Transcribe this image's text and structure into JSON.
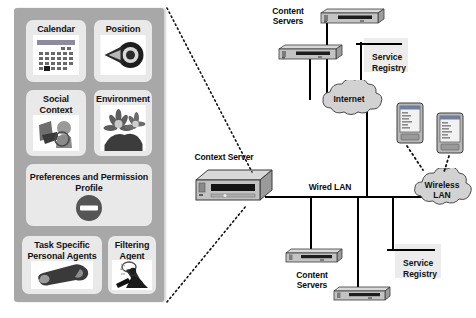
{
  "figure": {
    "background_color": "#ffffff",
    "panel_color": "#a8a8a8",
    "tile_color": "#e9e9e9",
    "wire_color": "#000000",
    "cloud_color": "#d0d0d0"
  },
  "client_panel": {
    "name": "Mobile client context panel",
    "tiles": [
      {
        "id": "calendar",
        "label": "Calendar",
        "icon": "calendar-icon"
      },
      {
        "id": "position",
        "label": "Position",
        "icon": "target-arrow-icon"
      },
      {
        "id": "social",
        "label": "Social\nContext",
        "icon": "handshake-people-icon"
      },
      {
        "id": "environment",
        "label": "Environment",
        "icon": "plants-flowers-icon"
      },
      {
        "id": "preferences",
        "label": "Preferences and\nPermission Profile",
        "icon": "no-entry-icon"
      },
      {
        "id": "task-agents",
        "label": "Task Specific\nPersonal Agents",
        "icon": "wrench-icon"
      },
      {
        "id": "filtering",
        "label": "Filtering\nAgent",
        "icon": "worker-shovel-icon"
      }
    ]
  },
  "network": {
    "nodes": [
      {
        "id": "content-servers-top",
        "label": "Content\nServers",
        "icon": "server-icon"
      },
      {
        "id": "service-registry-top",
        "label": "Service\nRegistry",
        "icon": "registry-icon"
      },
      {
        "id": "internet-cloud",
        "label": "Internet",
        "icon": "cloud-icon"
      },
      {
        "id": "context-server",
        "label": "Context Server",
        "icon": "context-server-icon"
      },
      {
        "id": "wired-lan",
        "label": "Wired LAN",
        "icon": "bus-line-icon"
      },
      {
        "id": "wireless-lan",
        "label": "Wireless\nLAN",
        "icon": "cloud-icon"
      },
      {
        "id": "content-servers-bottom",
        "label": "Content\nServers",
        "icon": "server-icon"
      },
      {
        "id": "service-registry-bottom",
        "label": "Service\nRegistry",
        "icon": "registry-icon"
      },
      {
        "id": "pda-left",
        "label": "",
        "icon": "pda-device-icon"
      },
      {
        "id": "pda-right",
        "label": "",
        "icon": "pda-device-icon"
      }
    ]
  }
}
